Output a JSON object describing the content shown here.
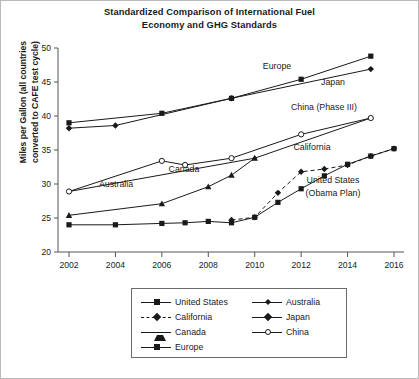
{
  "chart_title_lines": [
    "Standardized Comparison of International Fuel",
    "Economy and GHG Standards"
  ],
  "ylabel_lines": [
    "Miles per Gallon (all countries",
    "converted to CAFE test cycle)"
  ],
  "legend": {
    "col1": [
      {
        "label": "United States",
        "marker": "square",
        "line": "solid"
      },
      {
        "label": "California",
        "marker": "diamond",
        "line": "dashed"
      },
      {
        "label": "Canada",
        "marker": "triangle",
        "line": "solid"
      },
      {
        "label": "Europe",
        "marker": "square",
        "line": "solid"
      }
    ],
    "col2": [
      {
        "label": "Australia",
        "marker": "diamond-sm",
        "line": "solid"
      },
      {
        "label": "Japan",
        "marker": "diamond",
        "line": "solid"
      },
      {
        "label": "China",
        "marker": "circle-open",
        "line": "solid"
      }
    ]
  },
  "inline_labels": [
    {
      "text": "Europe",
      "x": 277,
      "y": 69
    },
    {
      "text": "Japan",
      "x": 333,
      "y": 85
    },
    {
      "text": "China (Phase III)",
      "x": 324,
      "y": 110
    },
    {
      "text": "California",
      "x": 312,
      "y": 150
    },
    {
      "text": "United States",
      "x": 333,
      "y": 183
    },
    {
      "text": "(Obama Plan)",
      "x": 333,
      "y": 196
    },
    {
      "text": "Australia",
      "x": 116,
      "y": 187
    },
    {
      "text": "Canada",
      "x": 184,
      "y": 172
    }
  ],
  "chart_data": {
    "type": "line",
    "title": "Standardized Comparison of International Fuel Economy and GHG Standards",
    "xlabel": "",
    "ylabel": "Miles per Gallon (all countries converted to CAFE test cycle)",
    "xlim": [
      2001,
      2016.6
    ],
    "ylim": [
      20,
      50
    ],
    "xticks": [
      2002,
      2004,
      2006,
      2008,
      2010,
      2012,
      2014,
      2016
    ],
    "yticks": [
      20,
      25,
      30,
      35,
      40,
      45,
      50
    ],
    "xtick_labels": [
      "2002",
      "2004",
      "2006",
      "2008",
      "2010",
      "2012",
      "2014",
      "2016"
    ],
    "ytick_labels": [
      "20",
      "25",
      "30",
      "35",
      "40",
      "45",
      "50"
    ],
    "grid": false,
    "legend_position": "below-plot",
    "series": [
      {
        "name": "United States",
        "marker": "square",
        "line": "solid",
        "x": [
          2002,
          2004,
          2006,
          2007,
          2008,
          2009,
          2010,
          2011,
          2012,
          2013,
          2014,
          2015,
          2016
        ],
        "values": [
          24.0,
          24.0,
          24.2,
          24.3,
          24.5,
          24.3,
          25.1,
          27.3,
          29.3,
          31.2,
          32.9,
          34.1,
          35.2
        ]
      },
      {
        "name": "California",
        "marker": "diamond",
        "line": "dashed",
        "x": [
          2009,
          2010,
          2011,
          2012,
          2013,
          2014,
          2015,
          2016
        ],
        "values": [
          24.7,
          25.1,
          28.7,
          31.8,
          32.2,
          32.8,
          34.1,
          35.2
        ]
      },
      {
        "name": "Canada",
        "marker": "triangle",
        "line": "solid",
        "x": [
          2002,
          2006,
          2008,
          2009,
          2010
        ],
        "values": [
          25.4,
          27.1,
          29.6,
          31.3,
          33.8
        ]
      },
      {
        "name": "Europe",
        "marker": "square",
        "line": "solid",
        "x": [
          2002,
          2006,
          2009,
          2012,
          2015
        ],
        "values": [
          39.0,
          40.4,
          42.6,
          45.4,
          48.8
        ]
      },
      {
        "name": "Australia",
        "marker": "diamond-sm",
        "line": "solid",
        "x": [
          2002,
          2010,
          2015
        ],
        "values": [
          28.9,
          33.8,
          39.7
        ]
      },
      {
        "name": "Japan",
        "marker": "diamond",
        "line": "solid",
        "x": [
          2002,
          2004,
          2009,
          2015
        ],
        "values": [
          38.2,
          38.6,
          42.6,
          46.9
        ]
      },
      {
        "name": "China",
        "marker": "circle-open",
        "line": "solid",
        "x": [
          2002,
          2006,
          2007,
          2009,
          2012,
          2015
        ],
        "values": [
          28.9,
          33.4,
          32.8,
          33.8,
          37.3,
          39.7
        ]
      }
    ]
  }
}
